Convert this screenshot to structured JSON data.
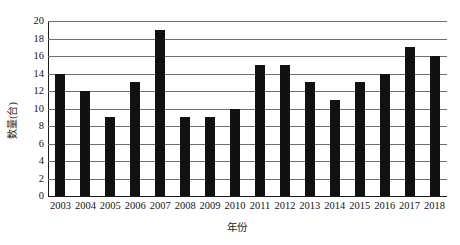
{
  "chart_data": {
    "type": "bar",
    "title": "",
    "xlabel": "年份",
    "ylabel": "数量(台)",
    "categories": [
      "2003",
      "2004",
      "2005",
      "2006",
      "2007",
      "2008",
      "2009",
      "2010",
      "2011",
      "2012",
      "2013",
      "2014",
      "2015",
      "2016",
      "2017",
      "2018"
    ],
    "values": [
      14,
      12,
      9,
      13,
      19,
      9,
      9,
      10,
      15,
      15,
      13,
      11,
      13,
      14,
      17,
      16
    ],
    "ylim": [
      0,
      20
    ],
    "ytick_values": [
      0,
      2,
      4,
      6,
      8,
      10,
      12,
      14,
      16,
      18,
      20
    ],
    "ytick_labels": [
      "0",
      "2",
      "4",
      "6",
      "8",
      "10",
      "12",
      "14",
      "16",
      "18",
      "20"
    ],
    "grid": true,
    "legend": false,
    "legend_position": "none",
    "bar_color": "#111111",
    "gridline_color": "#6f6f6f",
    "axis_color": "#1a1a1a",
    "background_color": "#ffffff",
    "series": [
      {
        "name": "数量(台)",
        "values": [
          14,
          12,
          9,
          13,
          19,
          9,
          9,
          10,
          15,
          15,
          13,
          11,
          13,
          14,
          17,
          16
        ]
      }
    ]
  }
}
